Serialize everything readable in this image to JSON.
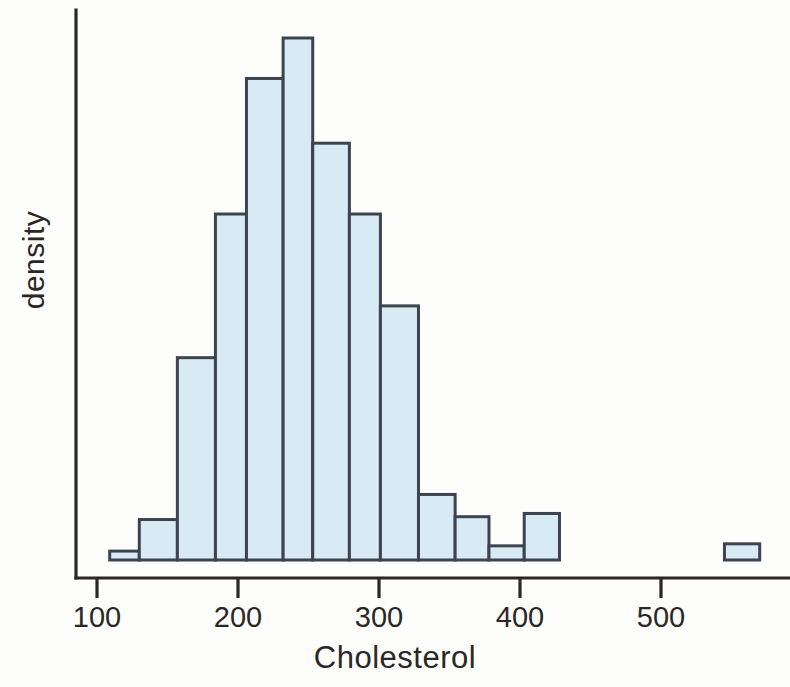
{
  "chart_data": {
    "type": "bar",
    "subtype": "histogram",
    "title": "",
    "xlabel": "Cholesterol",
    "ylabel": "density",
    "xlim": [
      95,
      580
    ],
    "ylim": [
      0,
      0.0105
    ],
    "grid": false,
    "legend": null,
    "xticks": [
      100,
      200,
      300,
      400,
      500
    ],
    "xtick_labels": [
      "100",
      "200",
      "300",
      "400",
      "500"
    ],
    "yticks": [],
    "ytick_labels": [],
    "bin_width": 25,
    "bin_edges": [
      109,
      130,
      157,
      184,
      206,
      232,
      253,
      279,
      301,
      328,
      354,
      378,
      403,
      428,
      545,
      570
    ],
    "bars": [
      {
        "x0": 109,
        "x1": 130,
        "density": 0.00022
      },
      {
        "x0": 130,
        "x1": 157,
        "density": 0.001
      },
      {
        "x0": 157,
        "x1": 184,
        "density": 0.005
      },
      {
        "x0": 184,
        "x1": 206,
        "density": 0.00855
      },
      {
        "x0": 206,
        "x1": 232,
        "density": 0.0119
      },
      {
        "x0": 232,
        "x1": 253,
        "density": 0.0129
      },
      {
        "x0": 253,
        "x1": 279,
        "density": 0.0103
      },
      {
        "x0": 279,
        "x1": 301,
        "density": 0.00855
      },
      {
        "x0": 301,
        "x1": 328,
        "density": 0.00628
      },
      {
        "x0": 328,
        "x1": 354,
        "density": 0.00162
      },
      {
        "x0": 354,
        "x1": 378,
        "density": 0.00107
      },
      {
        "x0": 378,
        "x1": 403,
        "density": 0.00035
      },
      {
        "x0": 403,
        "x1": 428,
        "density": 0.00115
      },
      {
        "x0": 545,
        "x1": 570,
        "density": 0.0004
      }
    ],
    "colors": {
      "bar_fill": "#d8eaf4",
      "bar_edge": "#3c4450",
      "axis": "#2b2724",
      "text": "#2b2724",
      "background": "#fdfdfc"
    }
  }
}
